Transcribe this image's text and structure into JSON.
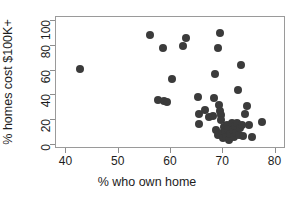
{
  "chart_data": {
    "type": "scatter",
    "title": "",
    "xlabel": "% who own home",
    "ylabel": "% homes cost $100K+",
    "xlim": [
      38,
      82
    ],
    "ylim": [
      -3,
      103
    ],
    "xticks": [
      40,
      50,
      60,
      70,
      80
    ],
    "yticks": [
      0,
      20,
      40,
      60,
      80,
      100
    ],
    "grid": false,
    "legend": null,
    "point_color": "#3b3b3b",
    "point_size_px": 8,
    "frame_color": "#9a9a9a",
    "background": "#ffffff",
    "n_points": 51,
    "points": [
      {
        "x": 42.5,
        "y": 61.5
      },
      {
        "x": 55.9,
        "y": 88.5
      },
      {
        "x": 57.6,
        "y": 36.5
      },
      {
        "x": 58.4,
        "y": 78.0
      },
      {
        "x": 58.6,
        "y": 35.5
      },
      {
        "x": 59.2,
        "y": 34.5
      },
      {
        "x": 60.2,
        "y": 53.5
      },
      {
        "x": 62.3,
        "y": 79.5
      },
      {
        "x": 62.8,
        "y": 86.5
      },
      {
        "x": 65.2,
        "y": 38.5
      },
      {
        "x": 65.3,
        "y": 25.5
      },
      {
        "x": 65.4,
        "y": 17.0
      },
      {
        "x": 66.5,
        "y": 28.5
      },
      {
        "x": 67.3,
        "y": 22.5
      },
      {
        "x": 68.0,
        "y": 23.5
      },
      {
        "x": 68.2,
        "y": 38.0
      },
      {
        "x": 68.4,
        "y": 57.5
      },
      {
        "x": 68.6,
        "y": 12.5
      },
      {
        "x": 68.9,
        "y": 8.5
      },
      {
        "x": 69.0,
        "y": 78.5
      },
      {
        "x": 69.2,
        "y": 32.0
      },
      {
        "x": 69.3,
        "y": 90.5
      },
      {
        "x": 69.4,
        "y": 27.5
      },
      {
        "x": 69.5,
        "y": 24.0
      },
      {
        "x": 69.6,
        "y": 20.0
      },
      {
        "x": 69.7,
        "y": 9.5
      },
      {
        "x": 69.9,
        "y": 5.5
      },
      {
        "x": 70.1,
        "y": 14.5
      },
      {
        "x": 70.3,
        "y": 11.0
      },
      {
        "x": 70.5,
        "y": 7.0
      },
      {
        "x": 70.7,
        "y": 16.5
      },
      {
        "x": 70.9,
        "y": 13.0
      },
      {
        "x": 71.1,
        "y": 4.5
      },
      {
        "x": 71.3,
        "y": 9.0
      },
      {
        "x": 71.6,
        "y": 18.0
      },
      {
        "x": 71.8,
        "y": 12.0
      },
      {
        "x": 72.0,
        "y": 6.5
      },
      {
        "x": 72.3,
        "y": 15.5
      },
      {
        "x": 72.5,
        "y": 10.0
      },
      {
        "x": 72.7,
        "y": 17.5
      },
      {
        "x": 72.9,
        "y": 44.5
      },
      {
        "x": 73.0,
        "y": 8.0
      },
      {
        "x": 73.2,
        "y": 14.0
      },
      {
        "x": 73.3,
        "y": 64.5
      },
      {
        "x": 73.5,
        "y": 16.0
      },
      {
        "x": 73.8,
        "y": 7.5
      },
      {
        "x": 74.2,
        "y": 25.0
      },
      {
        "x": 74.6,
        "y": 31.5
      },
      {
        "x": 74.9,
        "y": 16.5
      },
      {
        "x": 75.4,
        "y": 6.5
      },
      {
        "x": 77.4,
        "y": 18.5
      }
    ]
  },
  "axes": {
    "x_tick_labels": [
      "40",
      "50",
      "60",
      "70",
      "80"
    ],
    "y_tick_labels": [
      "0",
      "20",
      "40",
      "60",
      "80",
      "100"
    ]
  }
}
